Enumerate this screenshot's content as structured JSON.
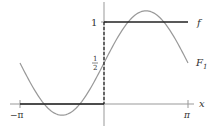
{
  "chart_data": {
    "type": "line",
    "title": "",
    "xlabel": "x",
    "ylabel": "",
    "xlim": [
      -3.14159,
      3.14159
    ],
    "ylim": [
      0,
      1.2
    ],
    "x_ticks": [
      "-π",
      "π"
    ],
    "y_ticks": [
      "1",
      "1/2"
    ],
    "grid": false,
    "legend": "inline labels at right",
    "series": [
      {
        "name": "f",
        "style": "dark solid step",
        "x": [
          -3.14159,
          0,
          0,
          3.14159
        ],
        "values": [
          0,
          0,
          1,
          1
        ],
        "note": "dashed vertical jump at x=0"
      },
      {
        "name": "F1",
        "style": "gray smooth curve",
        "formula": "1/2 + (2/pi) sin x",
        "x": [
          -3.14159,
          -1.5708,
          0,
          1.5708,
          3.14159
        ],
        "values": [
          0.5,
          -0.137,
          0.5,
          1.137,
          0.5
        ]
      }
    ],
    "annotations": [
      "1",
      "1/2",
      "f",
      "F1",
      "-π",
      "π",
      "x"
    ]
  },
  "labels": {
    "one": "1",
    "half_num": "1",
    "half_den": "2",
    "f": "f",
    "F": "F",
    "F_sub": "1",
    "neg_pi": "−π",
    "pi": "π",
    "x": "x"
  }
}
